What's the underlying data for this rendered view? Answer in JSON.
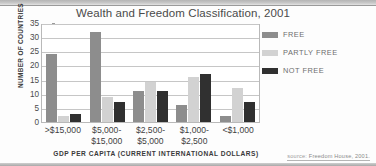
{
  "chart_data": {
    "type": "bar",
    "title": "Wealth and Freedom Classification, 2001",
    "xlabel": "GDP PER CAPITA (CURRENT INTERNATIONAL DOLLARS)",
    "ylabel": "NUMBER OF COUNTRIES",
    "categories": [
      ">$15,000",
      "$5,000-$15,000",
      "$2,500-$5,000",
      "$1,000-$2,500",
      "<$1,000"
    ],
    "category_lines": [
      [
        ">$15,000"
      ],
      [
        "$5,000-",
        "$15,000"
      ],
      [
        "$2,500-",
        "$5,000"
      ],
      [
        "$1,000-",
        "$2,500"
      ],
      [
        "<$1,000"
      ]
    ],
    "series": [
      {
        "name": "FREE",
        "color": "#8d8d8d",
        "values": [
          24,
          32,
          11,
          6,
          2
        ]
      },
      {
        "name": "PARTLY FREE",
        "color": "#d2d2d2",
        "values": [
          2,
          9,
          14,
          16,
          12
        ]
      },
      {
        "name": "NOT FREE",
        "color": "#303030",
        "values": [
          3,
          7,
          11,
          17,
          7
        ]
      }
    ],
    "ylim": [
      0,
      35
    ],
    "yticks": [
      0,
      5,
      10,
      15,
      20,
      25,
      30,
      35
    ],
    "ytick_labels": [
      "0",
      "5",
      "10",
      "15",
      "20",
      "25",
      "30",
      "35"
    ],
    "grid": true,
    "legend_position": "right"
  },
  "source": {
    "prefix": "source:",
    "text": "Freedom House, 2001."
  }
}
